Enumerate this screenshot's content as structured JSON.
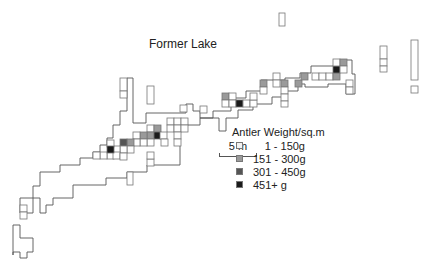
{
  "title": "Former Lake",
  "scale": {
    "label": "5 m"
  },
  "legend": {
    "title": "Antler Weight/sq.m",
    "items": [
      {
        "label": "1 - 150g",
        "color": "#f2f2f2"
      },
      {
        "label": "151 - 300g",
        "color": "#9a9a9a"
      },
      {
        "label": "301 - 450g",
        "color": "#555555"
      },
      {
        "label": "451+ g",
        "color": "#1a1a1a"
      }
    ]
  },
  "colors": {
    "outline": "#555555",
    "cell_border": "#777777"
  },
  "chart_data": {
    "type": "heatmap",
    "title": "Former Lake",
    "legend_title": "Antler Weight/sq.m",
    "classes": [
      "1 - 150g",
      "151 - 300g",
      "301 - 450g",
      "451+ g"
    ],
    "scale_bar": "5 m",
    "grid_unit_px": 6.6,
    "outline": "M13,255 L13,225 L20,225 L20,238 L33,238 L33,252 L27,252 L27,258 L20,258 L20,252 L13,252 Z M20,213 L20,198 L33,198 L33,186 L40,186 L40,172 L60,172 L60,165 L80,165 L80,158 L93,158 L93,152 L100,152 L100,145 L107,145 L107,138 L113,138 L113,125 L120,125 L120,111 L127,111 L127,78 L133,78 L133,123 L146,123 L146,113 L186,113 L186,104 L193,104 L193,111 L200,111 L200,118 L213,118 L213,111 L231,111 L231,98 L246,98 L246,91 L261,91 L261,80 L285,80 L285,78 L300,78 L300,73 L311,73 L311,66 L335,66 L335,60 L342,60 L342,60 L352,60 L352,74 L355,74 L355,94 L346,94 L346,84 L328,84 L328,87 L305,87 L305,84 L298,84 L298,91 L285,91 L285,97 L272,97 L272,104 L253,104 L253,110 L238,110 L238,118 L226,118 L226,131 L219,131 L219,118 L200,118 L200,125 L180,125 L180,165 L147,165 L147,172 L127,172 L127,178 L106,178 L106,185 L73,185 L73,198 L53,198 L53,205 L46,205 L46,213 L40,213 L40,198 L33,198 L33,213 Z",
    "cells": [
      {
        "x": 120,
        "y": 78,
        "w": 7,
        "h": 13,
        "v": 0
      },
      {
        "x": 120,
        "y": 91,
        "w": 7,
        "h": 7,
        "v": 0
      },
      {
        "x": 147,
        "y": 86,
        "w": 7,
        "h": 18,
        "v": 0
      },
      {
        "x": 180,
        "y": 105,
        "w": 7,
        "h": 7,
        "v": 0
      },
      {
        "x": 200,
        "y": 106,
        "w": 7,
        "h": 7,
        "v": 0
      },
      {
        "x": 167,
        "y": 118,
        "w": 7,
        "h": 7,
        "v": 0
      },
      {
        "x": 174,
        "y": 118,
        "w": 7,
        "h": 7,
        "v": 0
      },
      {
        "x": 181,
        "y": 118,
        "w": 7,
        "h": 7,
        "v": 0
      },
      {
        "x": 147,
        "y": 125,
        "w": 7,
        "h": 7,
        "v": 0
      },
      {
        "x": 154,
        "y": 125,
        "w": 7,
        "h": 7,
        "v": 1
      },
      {
        "x": 167,
        "y": 125,
        "w": 7,
        "h": 7,
        "v": 0
      },
      {
        "x": 174,
        "y": 125,
        "w": 7,
        "h": 7,
        "v": 0
      },
      {
        "x": 181,
        "y": 125,
        "w": 7,
        "h": 7,
        "v": 0
      },
      {
        "x": 147,
        "y": 132,
        "w": 7,
        "h": 7,
        "v": 1
      },
      {
        "x": 154,
        "y": 132,
        "w": 7,
        "h": 7,
        "v": 3
      },
      {
        "x": 140,
        "y": 132,
        "w": 7,
        "h": 7,
        "v": 1
      },
      {
        "x": 133,
        "y": 132,
        "w": 7,
        "h": 7,
        "v": 0
      },
      {
        "x": 147,
        "y": 139,
        "w": 7,
        "h": 7,
        "v": 0
      },
      {
        "x": 140,
        "y": 139,
        "w": 7,
        "h": 7,
        "v": 0
      },
      {
        "x": 133,
        "y": 139,
        "w": 7,
        "h": 7,
        "v": 0
      },
      {
        "x": 127,
        "y": 139,
        "w": 7,
        "h": 7,
        "v": 1
      },
      {
        "x": 120,
        "y": 139,
        "w": 7,
        "h": 7,
        "v": 2
      },
      {
        "x": 127,
        "y": 146,
        "w": 7,
        "h": 7,
        "v": 0
      },
      {
        "x": 120,
        "y": 146,
        "w": 7,
        "h": 7,
        "v": 0
      },
      {
        "x": 113,
        "y": 146,
        "w": 7,
        "h": 7,
        "v": 0
      },
      {
        "x": 107,
        "y": 152,
        "w": 7,
        "h": 7,
        "v": 0
      },
      {
        "x": 100,
        "y": 152,
        "w": 7,
        "h": 7,
        "v": 0
      },
      {
        "x": 93,
        "y": 152,
        "w": 7,
        "h": 7,
        "v": 0
      },
      {
        "x": 160,
        "y": 132,
        "w": 7,
        "h": 7,
        "v": 0
      },
      {
        "x": 161,
        "y": 139,
        "w": 7,
        "h": 7,
        "v": 0
      },
      {
        "x": 174,
        "y": 132,
        "w": 7,
        "h": 7,
        "v": 0
      },
      {
        "x": 174,
        "y": 139,
        "w": 7,
        "h": 7,
        "v": 0
      },
      {
        "x": 113,
        "y": 152,
        "w": 7,
        "h": 7,
        "v": 0
      },
      {
        "x": 107,
        "y": 140,
        "w": 7,
        "h": 7,
        "v": 0
      },
      {
        "x": 107,
        "y": 146,
        "w": 7,
        "h": 7,
        "v": 3
      },
      {
        "x": 120,
        "y": 153,
        "w": 7,
        "h": 7,
        "v": 0
      },
      {
        "x": 147,
        "y": 159,
        "w": 7,
        "h": 7,
        "v": 0
      },
      {
        "x": 147,
        "y": 152,
        "w": 7,
        "h": 7,
        "v": 0
      },
      {
        "x": 127,
        "y": 172,
        "w": 6,
        "h": 13,
        "v": 0
      },
      {
        "x": 20,
        "y": 205,
        "w": 7,
        "h": 7,
        "v": 0
      },
      {
        "x": 20,
        "y": 212,
        "w": 7,
        "h": 7,
        "v": 0
      },
      {
        "x": 222,
        "y": 93,
        "w": 7,
        "h": 7,
        "v": 1
      },
      {
        "x": 229,
        "y": 93,
        "w": 7,
        "h": 7,
        "v": 0
      },
      {
        "x": 222,
        "y": 100,
        "w": 7,
        "h": 7,
        "v": 0
      },
      {
        "x": 229,
        "y": 100,
        "w": 7,
        "h": 7,
        "v": 0
      },
      {
        "x": 236,
        "y": 100,
        "w": 7,
        "h": 7,
        "v": 3
      },
      {
        "x": 243,
        "y": 100,
        "w": 7,
        "h": 7,
        "v": 0
      },
      {
        "x": 250,
        "y": 100,
        "w": 7,
        "h": 7,
        "v": 0
      },
      {
        "x": 250,
        "y": 93,
        "w": 7,
        "h": 7,
        "v": 0
      },
      {
        "x": 260,
        "y": 80,
        "w": 7,
        "h": 7,
        "v": 1
      },
      {
        "x": 260,
        "y": 87,
        "w": 7,
        "h": 7,
        "v": 0
      },
      {
        "x": 273,
        "y": 73,
        "w": 7,
        "h": 7,
        "v": 0
      },
      {
        "x": 273,
        "y": 80,
        "w": 7,
        "h": 7,
        "v": 0
      },
      {
        "x": 281,
        "y": 80,
        "w": 7,
        "h": 7,
        "v": 1
      },
      {
        "x": 281,
        "y": 87,
        "w": 7,
        "h": 7,
        "v": 0
      },
      {
        "x": 281,
        "y": 94,
        "w": 7,
        "h": 7,
        "v": 0
      },
      {
        "x": 281,
        "y": 101,
        "w": 7,
        "h": 6,
        "v": 0
      },
      {
        "x": 295,
        "y": 80,
        "w": 7,
        "h": 7,
        "v": 1
      },
      {
        "x": 301,
        "y": 73,
        "w": 7,
        "h": 7,
        "v": 1
      },
      {
        "x": 312,
        "y": 73,
        "w": 7,
        "h": 7,
        "v": 0
      },
      {
        "x": 319,
        "y": 73,
        "w": 7,
        "h": 7,
        "v": 0
      },
      {
        "x": 326,
        "y": 73,
        "w": 7,
        "h": 7,
        "v": 0
      },
      {
        "x": 333,
        "y": 73,
        "w": 7,
        "h": 7,
        "v": 1
      },
      {
        "x": 333,
        "y": 66,
        "w": 7,
        "h": 7,
        "v": 3
      },
      {
        "x": 333,
        "y": 59,
        "w": 7,
        "h": 7,
        "v": 0
      },
      {
        "x": 340,
        "y": 59,
        "w": 7,
        "h": 7,
        "v": 1
      },
      {
        "x": 340,
        "y": 66,
        "w": 7,
        "h": 7,
        "v": 0
      },
      {
        "x": 346,
        "y": 80,
        "w": 7,
        "h": 7,
        "v": 0
      },
      {
        "x": 346,
        "y": 87,
        "w": 7,
        "h": 7,
        "v": 0
      },
      {
        "x": 279,
        "y": 13,
        "w": 6,
        "h": 13,
        "v": 0
      },
      {
        "x": 380,
        "y": 46,
        "w": 7,
        "h": 13,
        "v": 0
      },
      {
        "x": 380,
        "y": 59,
        "w": 7,
        "h": 7,
        "v": 0
      },
      {
        "x": 380,
        "y": 66,
        "w": 7,
        "h": 6,
        "v": 0
      },
      {
        "x": 411,
        "y": 40,
        "w": 7,
        "h": 40,
        "v": 0
      },
      {
        "x": 411,
        "y": 86,
        "w": 7,
        "h": 7,
        "v": 0
      }
    ]
  }
}
